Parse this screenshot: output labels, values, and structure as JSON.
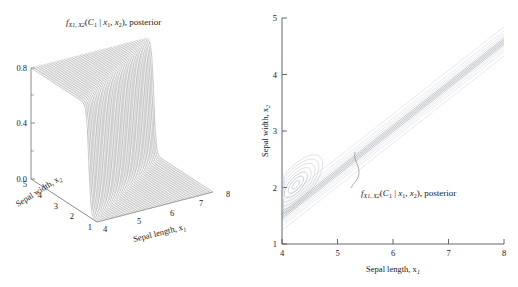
{
  "figure": {
    "panels": [
      "surface",
      "contour"
    ]
  },
  "left_panel": {
    "title_parts": {
      "f": "f",
      "f_sub": "X1, X2",
      "open": "(",
      "C": "C",
      "C_sub": "1",
      "bar": " | ",
      "x1": "x",
      "x1_sub": "1",
      "comma": ", ",
      "x2": "x",
      "x2_sub": "2",
      "close": "), posterior"
    },
    "z_ticks": [
      "0.0",
      "0.4",
      "0.8"
    ],
    "y_ticks": [
      "5",
      "4",
      "3",
      "2",
      "1"
    ],
    "x_ticks": [
      "4",
      "5",
      "6",
      "7",
      "8"
    ],
    "x_axis_label": "Sepal length, x",
    "x_axis_label_sub": "1",
    "y_axis_label": "Sepal width, x",
    "y_axis_label_sub": "2"
  },
  "right_panel": {
    "x_ticks": [
      "4",
      "5",
      "6",
      "7",
      "8"
    ],
    "y_ticks": [
      "1",
      "2",
      "3",
      "4",
      "5"
    ],
    "x_axis_label": "Sepal length, x",
    "x_axis_label_sub": "1",
    "y_axis_label": "Sepal width, x",
    "y_axis_label_sub": "2",
    "annotation_parts": {
      "f": "f",
      "f_sub": "X1, X2",
      "open": "(",
      "C": "C",
      "C_sub": "1",
      "bar": " | ",
      "x1": "x",
      "x1_sub": "1",
      "comma": ", ",
      "x2": "x",
      "x2_sub": "2",
      "close": "), posterior"
    }
  },
  "colors": {
    "mesh": "#9a9a9a",
    "mesh_light": "#c9c9c9",
    "contour": "#a8b0bc",
    "contour_dark": "#7c848f",
    "axis": "#6e6e6e",
    "text": "#1a1a1a",
    "background": "#ffffff"
  },
  "chart_data": [
    {
      "type": "surface",
      "title": "f_{X1,X2}(C_1 | x_1, x_2), posterior",
      "xlabel": "Sepal length, x1",
      "ylabel": "Sepal width, x2",
      "zlabel": "posterior probability",
      "xlim": [
        4,
        8
      ],
      "ylim": [
        1,
        5
      ],
      "zlim": [
        0.0,
        1.0
      ],
      "x_ticks": [
        4,
        5,
        6,
        7,
        8
      ],
      "y_ticks": [
        5,
        4,
        3,
        2,
        1
      ],
      "z_ticks": [
        0.0,
        0.4,
        0.8
      ],
      "description": "Sigmoid step surface: posterior near 1 for small sepal length / large sepal width region (back-left plateau), falling steeply to 0 across a narrow transition ridge near sepal length 5, with a narrow notch/valley at low sepal width.",
      "grid": true,
      "legend": "none"
    },
    {
      "type": "contour",
      "xlabel": "Sepal length, x1",
      "ylabel": "Sepal width, x2",
      "xlim": [
        4,
        8
      ],
      "ylim": [
        1,
        5
      ],
      "x_ticks": [
        4,
        5,
        6,
        7,
        8
      ],
      "y_ticks": [
        1,
        2,
        3,
        4,
        5
      ],
      "annotation": "f_{X1,X2}(C_1 | x_1, x_2), posterior",
      "annotation_xy": [
        5.45,
        3.05
      ],
      "annotation_text_xy": [
        5.55,
        2.45
      ],
      "description": "Nested contour lines of the posterior forming a narrow diagonal band running from lower-left (4, 1.4) up to upper-right (7.4, 5), widening into a bulbous lobe of closed contours centred near (4.25, 2.05).",
      "grid": false,
      "legend": "none"
    }
  ]
}
